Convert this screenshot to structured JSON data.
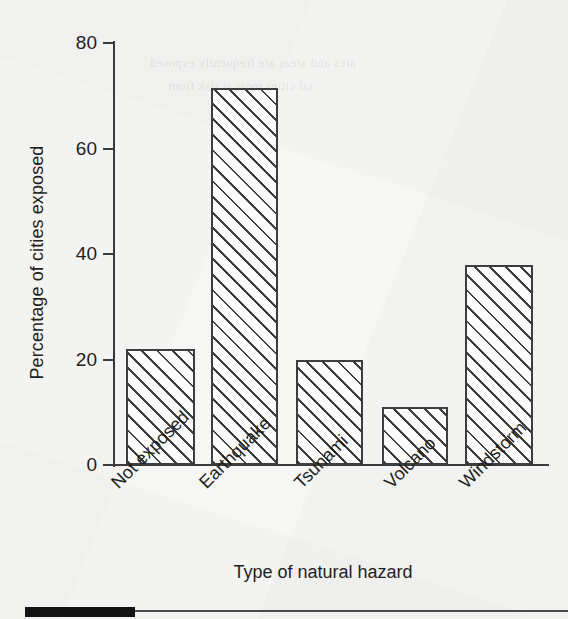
{
  "chart_data": {
    "type": "bar",
    "title": "",
    "xlabel": "Type of natural hazard",
    "ylabel": "Percentage of cities exposed",
    "categories": [
      "Not exposed",
      "Earthquake",
      "Tsunami",
      "Volcano",
      "Windstorm"
    ],
    "values": [
      22,
      71.5,
      20,
      11,
      38
    ],
    "ylim": [
      0,
      80
    ],
    "yticks": [
      0,
      20,
      40,
      60,
      80
    ],
    "ytick_labels": [
      "0",
      "20",
      "40",
      "60",
      "80"
    ],
    "grid": false,
    "legend": null,
    "bar_fill": "diagonal-hatch",
    "bar_edge_color": "#3d3d3d",
    "axis_color": "#3a3a3a",
    "background_color": "#f7f7f5"
  },
  "footer": {
    "swatch_color": "#141414"
  },
  "bleed_through": {
    "line1": "arcs and areas are frequently exposed",
    "line2": "tal cities most at risk from"
  }
}
